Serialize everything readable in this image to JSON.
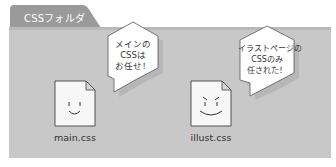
{
  "folder": {
    "tab_label": "CSSフォルダ",
    "tab_color": "#9a9a9a",
    "panel_color": "#c8c8c8"
  },
  "files": [
    {
      "name": "main.css",
      "face": "smile",
      "bubble": {
        "lines": [
          "メインの",
          "CSSは",
          "お任せ！"
        ]
      }
    },
    {
      "name": "illust.css",
      "face": "determined",
      "bubble": {
        "lines": [
          "イラストページの",
          "CSSのみ",
          "任された！"
        ]
      }
    }
  ]
}
